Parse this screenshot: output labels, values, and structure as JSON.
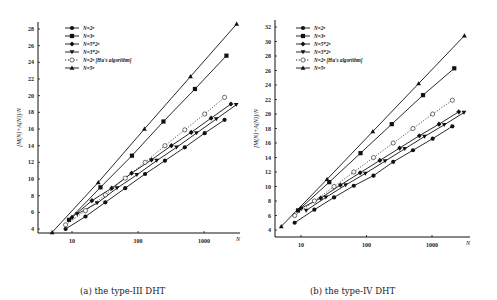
{
  "captions": {
    "left": "(a) the type-III DHT",
    "right": "(b) the type-IV DHT"
  },
  "chart_data": [
    {
      "type": "line",
      "title": "(a) the type-III DHT",
      "xlabel": "N",
      "ylabel": "[M(N)+A(N)]/N",
      "xscale": "log",
      "xticks": [
        "10",
        "100",
        "1000"
      ],
      "yticks": [
        4,
        6,
        8,
        10,
        12,
        14,
        16,
        18,
        20,
        22,
        24,
        26,
        28
      ],
      "ylim": [
        3,
        29
      ],
      "legend_position": "upper left",
      "series": [
        {
          "name": "N=2^n",
          "marker": "filled-circle",
          "style": "solid",
          "x": [
            8,
            16,
            32,
            64,
            128,
            256,
            512,
            1024,
            2048
          ],
          "values": [
            4.0,
            5.5,
            7.2,
            8.9,
            10.6,
            12.2,
            13.8,
            15.5,
            17.1
          ]
        },
        {
          "name": "N=3^n",
          "marker": "filled-square",
          "style": "solid",
          "x": [
            9,
            27,
            81,
            243,
            729,
            2187
          ],
          "values": [
            5.1,
            9.0,
            12.8,
            16.9,
            20.8,
            24.8
          ]
        },
        {
          "name": "N=5*2^n",
          "marker": "filled-diamond",
          "style": "solid",
          "x": [
            10,
            20,
            40,
            80,
            160,
            320,
            640,
            1280,
            2560
          ],
          "values": [
            5.4,
            7.4,
            8.9,
            10.7,
            12.3,
            14.0,
            15.6,
            17.3,
            19.0
          ]
        },
        {
          "name": "N=3*2^n",
          "marker": "filled-down-triangle",
          "style": "solid",
          "x": [
            12,
            24,
            48,
            96,
            192,
            384,
            768,
            1536,
            3072
          ],
          "values": [
            5.8,
            7.1,
            8.9,
            10.5,
            12.2,
            13.8,
            15.5,
            17.2,
            18.9
          ]
        },
        {
          "name": "N=2^n [Hu's algorithm]",
          "marker": "open-circle",
          "style": "dotted",
          "x": [
            8,
            16,
            32,
            64,
            128,
            256,
            512,
            1024,
            2048
          ],
          "values": [
            4.5,
            6.2,
            8.1,
            10.1,
            12.0,
            14.0,
            15.9,
            17.8,
            19.8
          ]
        },
        {
          "name": "N=5^n",
          "marker": "filled-triangle",
          "style": "solid",
          "x": [
            5,
            25,
            125,
            625,
            3125
          ],
          "values": [
            3.6,
            9.6,
            16.0,
            22.3,
            28.6
          ]
        }
      ]
    },
    {
      "type": "line",
      "title": "(b) the type-IV DHT",
      "xlabel": "N",
      "ylabel": "[M(N)+A(N)]/N",
      "xscale": "log",
      "xticks": [
        "10",
        "100",
        "1000"
      ],
      "yticks": [
        4,
        6,
        8,
        10,
        12,
        14,
        16,
        18,
        20,
        22,
        24,
        26,
        28,
        30,
        32
      ],
      "ylim": [
        3,
        33
      ],
      "legend_position": "upper left",
      "series": [
        {
          "name": "N=2^n",
          "marker": "filled-circle",
          "style": "solid",
          "x": [
            8,
            16,
            32,
            64,
            128,
            256,
            512,
            1024,
            2048
          ],
          "values": [
            5.0,
            6.8,
            8.5,
            10.1,
            11.5,
            13.4,
            15.0,
            16.6,
            18.3
          ]
        },
        {
          "name": "N=3^n",
          "marker": "filled-square",
          "style": "solid",
          "x": [
            9,
            27,
            81,
            243,
            729,
            2187
          ],
          "values": [
            6.7,
            10.6,
            14.6,
            18.6,
            22.6,
            26.3
          ]
        },
        {
          "name": "N=5*2^n",
          "marker": "filled-diamond",
          "style": "solid",
          "x": [
            10,
            20,
            40,
            80,
            160,
            320,
            640,
            1280,
            2560
          ],
          "values": [
            7.0,
            8.4,
            10.2,
            11.9,
            13.6,
            15.3,
            17.0,
            18.6,
            20.3
          ]
        },
        {
          "name": "N=3*2^n",
          "marker": "filled-down-triangle",
          "style": "solid",
          "x": [
            12,
            24,
            48,
            96,
            192,
            384,
            768,
            1536,
            3072
          ],
          "values": [
            6.7,
            8.5,
            10.2,
            11.8,
            13.5,
            15.2,
            16.9,
            18.5,
            20.2
          ]
        },
        {
          "name": "N=2^n [Hu's algorithm]",
          "marker": "open-circle",
          "style": "dotted",
          "x": [
            8,
            16,
            32,
            64,
            128,
            256,
            512,
            1024,
            2048
          ],
          "values": [
            6.0,
            8.0,
            10.0,
            12.0,
            14.0,
            16.0,
            18.0,
            20.0,
            21.9
          ]
        },
        {
          "name": "N=5^n",
          "marker": "filled-triangle",
          "style": "solid",
          "x": [
            5,
            25,
            125,
            625,
            3125
          ],
          "values": [
            4.5,
            11.0,
            17.6,
            24.2,
            30.8
          ]
        }
      ]
    }
  ],
  "layout": [
    {
      "left": 0,
      "axisX0": 38,
      "axisX1": 240,
      "axisYTop": 22,
      "axisYBottom": 233,
      "ypxTop": 29,
      "yvalTop": 28,
      "ypxBot": 229,
      "yvalBot": 4,
      "xpx10": 72,
      "xpxDecade": 66,
      "legendX": 65,
      "legendY": 28
    },
    {
      "left": 249,
      "axisX0": 275,
      "axisX1": 470,
      "axisYTop": 20,
      "axisYBottom": 237,
      "ypxTop": 27,
      "yvalTop": 32,
      "ypxBot": 230,
      "yvalBot": 4,
      "xpx10": 301,
      "xpxDecade": 65.5,
      "legendX": 296,
      "legendY": 28
    }
  ]
}
